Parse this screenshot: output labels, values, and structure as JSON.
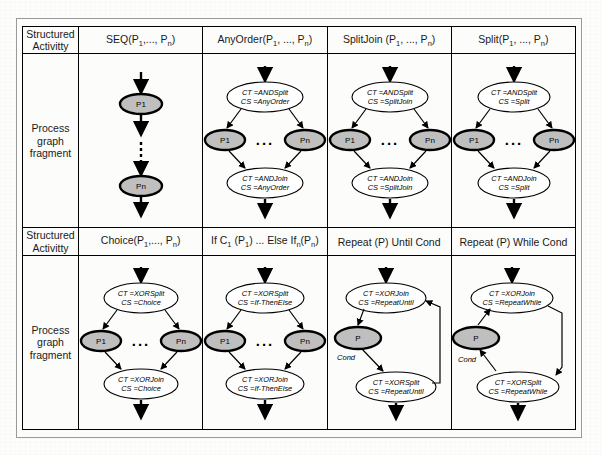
{
  "figure": {
    "row_header_label_1": "Structured Activitty",
    "row_header_label_2": "Process graph fragment",
    "row_header_line1": "Structured",
    "row_header_line2": "Activitty",
    "frag_line1": "Process",
    "frag_line2": "graph",
    "frag_line3": "fragment"
  },
  "columns": {
    "row1": [
      {
        "id": "seq",
        "title_main": "SEQ(P",
        "title_sub1": "1",
        "title_mid": ",..., P",
        "title_sub2": "n",
        "title_end": ")",
        "title_plain": "SEQ(P1,..., Pn)"
      },
      {
        "id": "anyorder",
        "title_main": "AnyOrder(P",
        "title_sub1": "1",
        "title_mid": ", ..., P",
        "title_sub2": "n",
        "title_end": ")",
        "title_plain": "AnyOrder(P1, ..., Pn)"
      },
      {
        "id": "splitjoin",
        "title_main": "SplitJoin (P",
        "title_sub1": "1",
        "title_mid": ", ..., P",
        "title_sub2": "n",
        "title_end": ")",
        "title_plain": "SplitJoin (P1, ..., Pn)"
      },
      {
        "id": "split",
        "title_main": "Split(P",
        "title_sub1": "1",
        "title_mid": ", ..., P",
        "title_sub2": "n",
        "title_end": ")",
        "title_plain": "Split(P1, ..., Pn)"
      }
    ],
    "row2": [
      {
        "id": "choice",
        "title_main": "Choice(P",
        "title_sub1": "1",
        "title_mid": ",..., P",
        "title_sub2": "n",
        "title_end": ")",
        "title_plain": "Choice(P1,..., Pn)"
      },
      {
        "id": "ifthenelse",
        "title_main": "If C",
        "title_sub1": "1",
        "title_mid": " (P",
        "title_sub2": "1",
        "title_end": ") ... Else If",
        "title_sub3": "n",
        "title_tail": "(P",
        "title_sub4": "n",
        "title_tail2": ")",
        "title_plain": "If C1 (P1) ... Else Ifn(Pn)"
      },
      {
        "id": "repeatuntil",
        "title_main": "Repeat (P) Until Cond",
        "title_plain": "Repeat (P) Until Cond"
      },
      {
        "id": "repeatwhile",
        "title_main": "Repeat (P) While Cond",
        "title_plain": "Repeat (P) While Cond"
      }
    ]
  },
  "fragments": {
    "seq": {
      "nodes": [
        "P1",
        "Pn"
      ],
      "ellipsis": "vertical-dashed"
    },
    "anyorder": {
      "split_gate": {
        "line1": "CT =ANDSplit",
        "line2": "CS =AnyOrder"
      },
      "join_gate": {
        "line1": "CT =ANDJoin",
        "line2": "CS =AnyOrder"
      },
      "nodes": [
        "P1",
        "Pn"
      ],
      "dots": "..."
    },
    "splitjoin": {
      "split_gate": {
        "line1": "CT =ANDSplit",
        "line2": "CS =SplitJoin"
      },
      "join_gate": {
        "line1": "CT =ANDJoin",
        "line2": "CS =SplitJoin"
      },
      "nodes": [
        "P1",
        "Pn"
      ],
      "dots": "..."
    },
    "split": {
      "split_gate": {
        "line1": "CT =ANDSplit",
        "line2": "CS =Split"
      },
      "join_gate": {
        "line1": "CT =ANDJoin",
        "line2": "CS =Split"
      },
      "nodes": [
        "P1",
        "Pn"
      ],
      "dots": "..."
    },
    "choice": {
      "split_gate": {
        "line1": "CT =XORSplit",
        "line2": "CS =Choice"
      },
      "join_gate": {
        "line1": "CT =XORJoin",
        "line2": "CS =Choice"
      },
      "nodes": [
        "P1",
        "Pn"
      ],
      "dots": "..."
    },
    "ifthenelse": {
      "split_gate": {
        "line1": "CT =XORSplit",
        "line2": "CS =If-ThenElse"
      },
      "join_gate": {
        "line1": "CT =XORJoin",
        "line2": "CS =If-ThenElse"
      },
      "nodes": [
        "P1",
        "Pn"
      ],
      "dots": "..."
    },
    "repeatuntil": {
      "join_gate": {
        "line1": "CT =XORJoin",
        "line2": "CS =RepeatUntil"
      },
      "split_gate": {
        "line1": "CT =XORSplit",
        "line2": "CS =RepeatUntil"
      },
      "node": "P",
      "cond": "Cond"
    },
    "repeatwhile": {
      "join_gate": {
        "line1": "CT =XORJoin",
        "line2": "CS =RepeatWhile"
      },
      "split_gate": {
        "line1": "CT =XORSplit",
        "line2": "CS =RepeatWhile"
      },
      "node": "P",
      "cond": "Cond"
    }
  },
  "colors": {
    "node_fill": "#bfbfbf",
    "gate_fill": "#ffffff",
    "stroke": "#000000",
    "page": "#fdfdfc"
  }
}
